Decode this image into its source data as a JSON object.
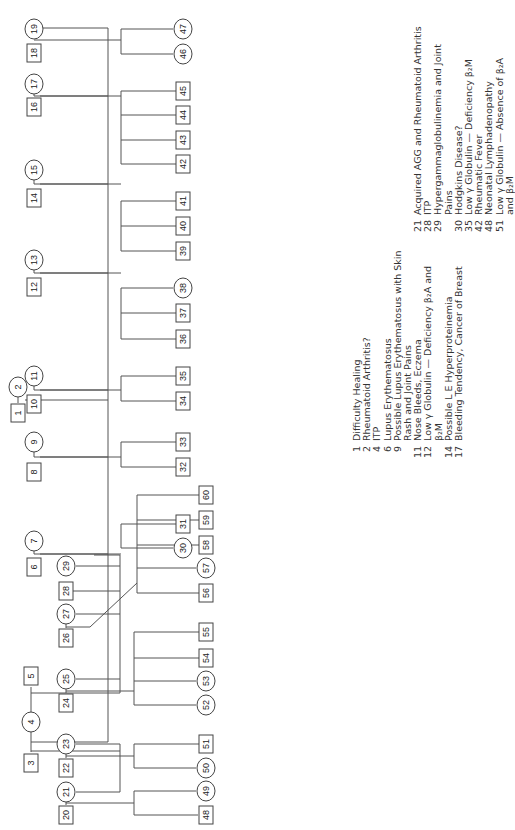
{
  "pedigree": {
    "nodes": [
      {
        "id": "1",
        "shape": "square",
        "x": 18,
        "y": 413
      },
      {
        "id": "2",
        "shape": "circle",
        "x": 18,
        "y": 387
      },
      {
        "id": "3",
        "shape": "square",
        "x": 31,
        "y": 763
      },
      {
        "id": "4",
        "shape": "circle",
        "x": 31,
        "y": 722
      },
      {
        "id": "5",
        "shape": "square",
        "x": 31,
        "y": 676
      },
      {
        "id": "6",
        "shape": "square",
        "x": 34,
        "y": 567
      },
      {
        "id": "7",
        "shape": "circle",
        "x": 34,
        "y": 541
      },
      {
        "id": "8",
        "shape": "square",
        "x": 34,
        "y": 472
      },
      {
        "id": "9",
        "shape": "circle",
        "x": 34,
        "y": 442
      },
      {
        "id": "10",
        "shape": "square",
        "x": 34,
        "y": 404
      },
      {
        "id": "11",
        "shape": "circle",
        "x": 34,
        "y": 376
      },
      {
        "id": "12",
        "shape": "square",
        "x": 34,
        "y": 287
      },
      {
        "id": "13",
        "shape": "circle",
        "x": 34,
        "y": 260
      },
      {
        "id": "14",
        "shape": "square",
        "x": 34,
        "y": 198
      },
      {
        "id": "15",
        "shape": "circle",
        "x": 34,
        "y": 170
      },
      {
        "id": "16",
        "shape": "square",
        "x": 34,
        "y": 107
      },
      {
        "id": "17",
        "shape": "circle",
        "x": 34,
        "y": 84
      },
      {
        "id": "18",
        "shape": "square",
        "x": 34,
        "y": 53
      },
      {
        "id": "19",
        "shape": "circle",
        "x": 34,
        "y": 29
      },
      {
        "id": "20",
        "shape": "square",
        "x": 66,
        "y": 815
      },
      {
        "id": "21",
        "shape": "circle",
        "x": 66,
        "y": 792
      },
      {
        "id": "22",
        "shape": "square",
        "x": 66,
        "y": 768
      },
      {
        "id": "23",
        "shape": "circle",
        "x": 66,
        "y": 744
      },
      {
        "id": "24",
        "shape": "square",
        "x": 66,
        "y": 703
      },
      {
        "id": "25",
        "shape": "circle",
        "x": 66,
        "y": 679
      },
      {
        "id": "26",
        "shape": "square",
        "x": 66,
        "y": 638
      },
      {
        "id": "27",
        "shape": "circle",
        "x": 66,
        "y": 614
      },
      {
        "id": "28",
        "shape": "square",
        "x": 66,
        "y": 591
      },
      {
        "id": "29",
        "shape": "circle",
        "x": 66,
        "y": 566
      },
      {
        "id": "30",
        "shape": "circle",
        "x": 183,
        "y": 548
      },
      {
        "id": "31",
        "shape": "square",
        "x": 183,
        "y": 524
      },
      {
        "id": "32",
        "shape": "square",
        "x": 183,
        "y": 467
      },
      {
        "id": "33",
        "shape": "square",
        "x": 183,
        "y": 442
      },
      {
        "id": "34",
        "shape": "square",
        "x": 183,
        "y": 401
      },
      {
        "id": "35",
        "shape": "square",
        "x": 183,
        "y": 376
      },
      {
        "id": "36",
        "shape": "square",
        "x": 183,
        "y": 339
      },
      {
        "id": "37",
        "shape": "square",
        "x": 183,
        "y": 313
      },
      {
        "id": "38",
        "shape": "circle",
        "x": 183,
        "y": 288
      },
      {
        "id": "39",
        "shape": "square",
        "x": 183,
        "y": 251
      },
      {
        "id": "40",
        "shape": "square",
        "x": 183,
        "y": 226
      },
      {
        "id": "41",
        "shape": "square",
        "x": 183,
        "y": 201
      },
      {
        "id": "42",
        "shape": "square",
        "x": 183,
        "y": 164
      },
      {
        "id": "43",
        "shape": "square",
        "x": 183,
        "y": 140
      },
      {
        "id": "44",
        "shape": "square",
        "x": 183,
        "y": 115
      },
      {
        "id": "45",
        "shape": "square",
        "x": 183,
        "y": 91
      },
      {
        "id": "46",
        "shape": "circle",
        "x": 183,
        "y": 54
      },
      {
        "id": "47",
        "shape": "circle",
        "x": 183,
        "y": 29
      },
      {
        "id": "48",
        "shape": "square",
        "x": 206,
        "y": 815
      },
      {
        "id": "49",
        "shape": "circle",
        "x": 206,
        "y": 791
      },
      {
        "id": "50",
        "shape": "circle",
        "x": 206,
        "y": 768
      },
      {
        "id": "51",
        "shape": "square",
        "x": 206,
        "y": 744
      },
      {
        "id": "52",
        "shape": "circle",
        "x": 206,
        "y": 705
      },
      {
        "id": "53",
        "shape": "circle",
        "x": 206,
        "y": 681
      },
      {
        "id": "54",
        "shape": "square",
        "x": 206,
        "y": 658
      },
      {
        "id": "55",
        "shape": "square",
        "x": 206,
        "y": 632
      },
      {
        "id": "56",
        "shape": "square",
        "x": 206,
        "y": 593
      },
      {
        "id": "57",
        "shape": "circle",
        "x": 206,
        "y": 568
      },
      {
        "id": "58",
        "shape": "square",
        "x": 206,
        "y": 545
      },
      {
        "id": "59",
        "shape": "square",
        "x": 206,
        "y": 520
      },
      {
        "id": "60",
        "shape": "square",
        "x": 206,
        "y": 495
      }
    ],
    "lines": [
      [
        25,
        400,
        108,
        400
      ],
      [
        18,
        397,
        18,
        403
      ],
      [
        108,
        28,
        108,
        742
      ],
      [
        108,
        742,
        31,
        742
      ],
      [
        31,
        733,
        31,
        752
      ],
      [
        31,
        733,
        31,
        687
      ],
      [
        31,
        751,
        120,
        751
      ],
      [
        120,
        751,
        120,
        792
      ],
      [
        31,
        693,
        120,
        693
      ],
      [
        120,
        693,
        120,
        555
      ],
      [
        120,
        555,
        94,
        555
      ],
      [
        108,
        554,
        40,
        554
      ],
      [
        108,
        457,
        40,
        457
      ],
      [
        108,
        390,
        40,
        390
      ],
      [
        108,
        273,
        40,
        273
      ],
      [
        108,
        184,
        40,
        184
      ],
      [
        108,
        96,
        40,
        96
      ],
      [
        108,
        28,
        40,
        28
      ],
      [
        34,
        554,
        34,
        551
      ],
      [
        34,
        457,
        34,
        452
      ],
      [
        34,
        390,
        34,
        386
      ],
      [
        34,
        273,
        34,
        270
      ],
      [
        34,
        184,
        34,
        180
      ],
      [
        34,
        96,
        34,
        94
      ],
      [
        120,
        792,
        76,
        792
      ],
      [
        120,
        744,
        76,
        744
      ],
      [
        120,
        679,
        76,
        679
      ],
      [
        120,
        614,
        76,
        614
      ],
      [
        120,
        591,
        72,
        591
      ],
      [
        120,
        566,
        76,
        566
      ],
      [
        120,
        744,
        120,
        751
      ],
      [
        66,
        805,
        66,
        802
      ],
      [
        66,
        758,
        66,
        754
      ],
      [
        66,
        693,
        66,
        689
      ],
      [
        66,
        628,
        66,
        624
      ],
      [
        66,
        803,
        134,
        803
      ],
      [
        134,
        815,
        134,
        791
      ],
      [
        134,
        815,
        198,
        815
      ],
      [
        134,
        791,
        196,
        791
      ],
      [
        66,
        756,
        134,
        756
      ],
      [
        134,
        768,
        134,
        744
      ],
      [
        134,
        768,
        196,
        768
      ],
      [
        134,
        744,
        199,
        744
      ],
      [
        66,
        691,
        134,
        691
      ],
      [
        134,
        705,
        134,
        632
      ],
      [
        134,
        705,
        196,
        705
      ],
      [
        134,
        681,
        196,
        681
      ],
      [
        134,
        658,
        199,
        658
      ],
      [
        134,
        632,
        199,
        632
      ],
      [
        66,
        627,
        90,
        627
      ],
      [
        90,
        627,
        137,
        583
      ],
      [
        137,
        593,
        137,
        495
      ],
      [
        137,
        593,
        199,
        593
      ],
      [
        137,
        568,
        196,
        568
      ],
      [
        137,
        545,
        199,
        545
      ],
      [
        137,
        520,
        199,
        520
      ],
      [
        137,
        495,
        199,
        495
      ],
      [
        34,
        554,
        121,
        554
      ],
      [
        121,
        548,
        121,
        524
      ],
      [
        121,
        548,
        173,
        548
      ],
      [
        121,
        524,
        176,
        524
      ],
      [
        34,
        457,
        121,
        457
      ],
      [
        121,
        467,
        121,
        442
      ],
      [
        121,
        467,
        176,
        467
      ],
      [
        121,
        442,
        176,
        442
      ],
      [
        34,
        390,
        121,
        390
      ],
      [
        121,
        401,
        121,
        376
      ],
      [
        121,
        401,
        176,
        401
      ],
      [
        121,
        376,
        176,
        376
      ],
      [
        34,
        273,
        121,
        273
      ],
      [
        121,
        339,
        121,
        288
      ],
      [
        121,
        339,
        176,
        339
      ],
      [
        121,
        313,
        176,
        313
      ],
      [
        121,
        288,
        173,
        288
      ],
      [
        34,
        184,
        121,
        184
      ],
      [
        121,
        251,
        121,
        201
      ],
      [
        121,
        251,
        176,
        251
      ],
      [
        121,
        226,
        176,
        226
      ],
      [
        121,
        201,
        176,
        201
      ],
      [
        34,
        96,
        121,
        96
      ],
      [
        121,
        164,
        121,
        91
      ],
      [
        121,
        164,
        176,
        164
      ],
      [
        121,
        140,
        176,
        140
      ],
      [
        121,
        115,
        176,
        115
      ],
      [
        121,
        91,
        176,
        91
      ],
      [
        34,
        40,
        121,
        40
      ],
      [
        121,
        54,
        121,
        29
      ],
      [
        121,
        54,
        173,
        54
      ],
      [
        121,
        29,
        173,
        29
      ]
    ]
  },
  "legend_left": [
    {
      "num": "1",
      "text": "Difficulty Healing"
    },
    {
      "num": "2",
      "text": "Rheumatoid Arthritis?"
    },
    {
      "num": "4",
      "text": "ITP"
    },
    {
      "num": "6",
      "text": "Lupus Erythematosus"
    },
    {
      "num": "9",
      "text": "Possible Lupus Erythematosus with Skin"
    },
    {
      "num": "",
      "text": "Rash and Joint Pains"
    },
    {
      "num": "11",
      "text": "Nose Bleeds, Eczema"
    },
    {
      "num": "12",
      "text": "Low γ Globulin — Deficiency β₂A and"
    },
    {
      "num": "",
      "text": "β₂M"
    },
    {
      "num": "14",
      "text": "Possible L E Hyperproteinemia"
    },
    {
      "num": "17",
      "text": "Bleeding Tendency, Cancer of Breast"
    }
  ],
  "legend_right": [
    {
      "num": "21",
      "text": "Acquired AGG and Rheumatoid Arthritis"
    },
    {
      "num": "28",
      "text": "ITP"
    },
    {
      "num": "29",
      "text": "Hypergammaglobulinemia and Joint"
    },
    {
      "num": "",
      "text": "Pains"
    },
    {
      "num": "30",
      "text": "Hodgkins Disease?"
    },
    {
      "num": "35",
      "text": "Low γ Globulin — Deficiency β₂M"
    },
    {
      "num": "42",
      "text": "Rheumatic Fever"
    },
    {
      "num": "48",
      "text": "Neonatal Lymphadenopathy"
    },
    {
      "num": "51",
      "text": "Low γ Globulin — Absence of β₂A"
    },
    {
      "num": "",
      "text": "and β₂M"
    }
  ]
}
